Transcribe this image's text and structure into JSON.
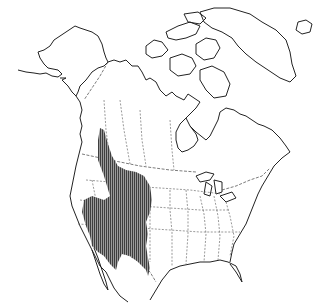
{
  "map": {
    "title": "Range map of North America",
    "region": "North America",
    "range_color": "#555555",
    "land_color": "#ffffff",
    "coast_color": "#222222",
    "range_description": "Western North America: Great Basin, Rocky Mountain region and Southwest into northern Mexico, with a narrow extension north into interior British Columbia"
  }
}
